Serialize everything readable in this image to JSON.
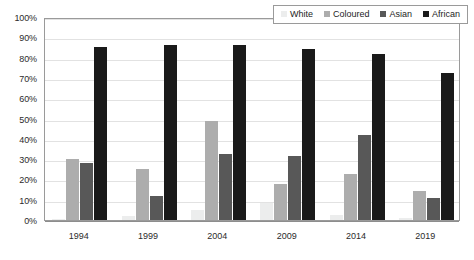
{
  "chart_data": {
    "type": "bar",
    "title": "",
    "xlabel": "",
    "ylabel": "",
    "ylim": [
      0,
      100
    ],
    "yticks": [
      "0%",
      "10%",
      "20%",
      "30%",
      "40%",
      "50%",
      "60%",
      "70%",
      "80%",
      "90%",
      "100%"
    ],
    "ytick_values": [
      0,
      10,
      20,
      30,
      40,
      50,
      60,
      70,
      80,
      90,
      100
    ],
    "grid": true,
    "legend_position": "top-right",
    "categories": [
      "1994",
      "1999",
      "2004",
      "2009",
      "2014",
      "2019"
    ],
    "series": [
      {
        "name": "White",
        "color": "#eceded",
        "values": [
          0.3,
          2.2,
          5.0,
          8.3,
          2.4,
          1.2
        ]
      },
      {
        "name": "Coloured",
        "color": "#adadad",
        "values": [
          30.1,
          25.2,
          49.0,
          17.6,
          22.8,
          14.3
        ]
      },
      {
        "name": "Asian",
        "color": "#585858",
        "values": [
          28.2,
          12.0,
          32.4,
          31.3,
          41.7,
          11.0
        ]
      },
      {
        "name": "African",
        "color": "#1a1a1a",
        "values": [
          85.0,
          86.1,
          86.1,
          84.3,
          81.7,
          72.6
        ]
      }
    ]
  },
  "axes": {
    "plot_border_color": "#9a9a9a",
    "gridline_color": "#e2e2e2",
    "baseline_color": "#8d8d8d"
  }
}
